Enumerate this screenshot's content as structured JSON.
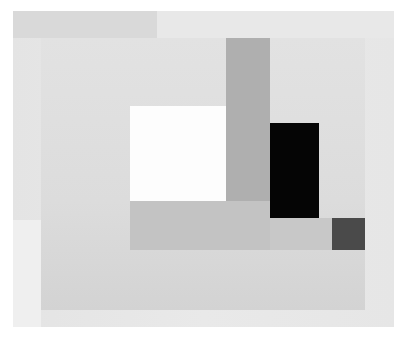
{
  "artwork": {
    "description": "Abstract geometric grayscale composition of overlapping rectangles",
    "colors": {
      "canvas": "#e6e6e6",
      "top_band": "#d9d9d9",
      "inner_panel": "#dcdcdc",
      "white_square": "#fdfdfd",
      "gray_vertical": "#afafaf",
      "black_rect": "#050505",
      "gray_horizontal": "#c3c3c3",
      "dark_square": "#4a4a4a"
    }
  }
}
